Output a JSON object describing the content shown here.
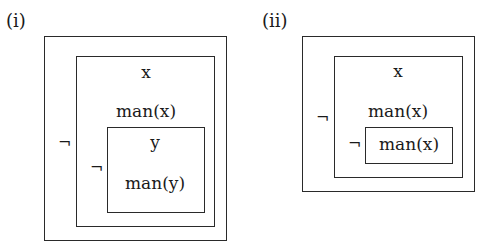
{
  "diagram_i": {
    "label": "(i)",
    "outer_box": {},
    "middle_box": {
      "var": "x",
      "predicate": "man(x)",
      "negation": "¬"
    },
    "inner_box": {
      "var": "y",
      "predicate": "man(y)",
      "negation": "¬"
    }
  },
  "diagram_ii": {
    "label": "(ii)",
    "outer_box": {},
    "middle_box": {
      "var": "x",
      "predicate": "man(x)",
      "negation": "¬"
    },
    "inner_box": {
      "predicate": "man(x)",
      "negation": "¬"
    }
  }
}
